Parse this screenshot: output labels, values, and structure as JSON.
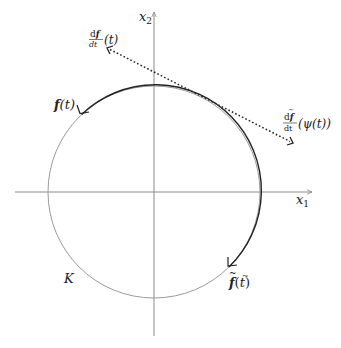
{
  "diagram": {
    "axes": {
      "x_label_var": "x",
      "x_label_sub": "1",
      "y_label_var": "x",
      "y_label_sub": "2",
      "color": "#8a8a8a"
    },
    "circle": {
      "label": "K",
      "center": [
        154,
        192
      ],
      "radius": 106,
      "color": "#9a9a9a"
    },
    "arc": {
      "color": "#222222",
      "start_label": {
        "func": "f",
        "arg": "(t)"
      },
      "end_label": {
        "func": "f",
        "arg": "(",
        "arg_var": "t",
        "arg_close": ")",
        "tilde": "~"
      }
    },
    "tangent": {
      "color": "#222222",
      "left_label": {
        "num_d": "d",
        "num_f": "f",
        "den": "dt",
        "arg": "(t)"
      },
      "right_label": {
        "num_d": "d",
        "num_f": "f",
        "den": "dt",
        "arg": "(ψ(t))",
        "tilde": "~"
      }
    }
  }
}
